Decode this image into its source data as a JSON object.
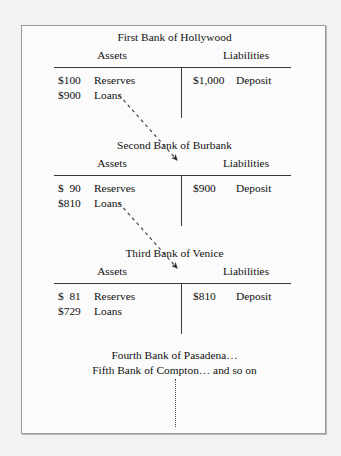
{
  "figure": {
    "type": "money-multiplier-t-accounts",
    "column_headers": {
      "assets": "Assets",
      "liabilities": "Liabilities"
    },
    "banks": [
      {
        "title": "First Bank of Hollywood",
        "assets": [
          {
            "amount": "$100",
            "label": "Reserves"
          },
          {
            "amount": "$900",
            "label": "Loans"
          }
        ],
        "liabilities": [
          {
            "amount": "$1,000",
            "label": "Deposit"
          }
        ]
      },
      {
        "title": "Second Bank of Burbank",
        "assets": [
          {
            "amount": "$  90",
            "label": "Reserves"
          },
          {
            "amount": "$810",
            "label": "Loans"
          }
        ],
        "liabilities": [
          {
            "amount": "$900",
            "label": "Deposit"
          }
        ]
      },
      {
        "title": "Third Bank of Venice",
        "assets": [
          {
            "amount": "$  81",
            "label": "Reserves"
          },
          {
            "amount": "$729",
            "label": "Loans"
          }
        ],
        "liabilities": [
          {
            "amount": "$810",
            "label": "Deposit"
          }
        ]
      }
    ],
    "footer": [
      "Fourth Bank of Pasadena…",
      "Fifth Bank of Compton… and so on"
    ],
    "connectors": [
      {
        "from_bank": 1,
        "to_bank": 2,
        "style": "dashed-arrow"
      },
      {
        "from_bank": 2,
        "to_bank": 3,
        "style": "dashed-arrow"
      }
    ],
    "continuation_marker": "vertical-dotted-line",
    "colors": {
      "page_background": "#f2f2f2",
      "panel_background": "#fbfbfb",
      "border": "#9a9a9a",
      "rule": "#3a3a3a",
      "text": "#111111",
      "connector": "#4a4a4a"
    }
  }
}
